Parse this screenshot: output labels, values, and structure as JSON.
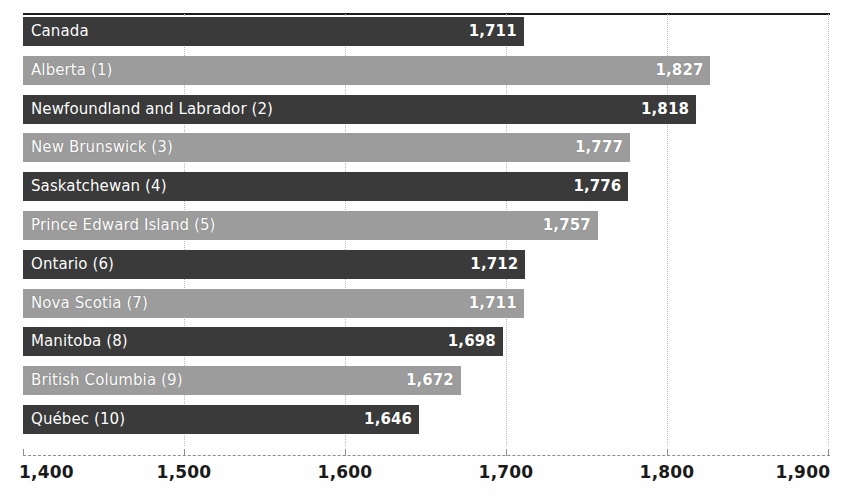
{
  "chart_data": {
    "type": "bar",
    "orientation": "horizontal",
    "title": "",
    "subtitle": "",
    "xlabel": "",
    "ylabel": "",
    "xlim": [
      1400,
      1900
    ],
    "x_ticks": [
      "1,400",
      "1,500",
      "1,600",
      "1,700",
      "1,800",
      "1,900"
    ],
    "x_tick_values": [
      1400,
      1500,
      1600,
      1700,
      1800,
      1900
    ],
    "grid": "vertical-dotted",
    "legend": "none",
    "categories": [
      "Canada",
      "Alberta (1)",
      "Newfoundland and Labrador (2)",
      "New Brunswick (3)",
      "Saskatchewan (4)",
      "Prince Edward Island (5)",
      "Ontario (6)",
      "Nova Scotia (7)",
      "Manitoba (8)",
      "British Columbia (9)",
      "Québec (10)"
    ],
    "values": [
      1711,
      1827,
      1818,
      1777,
      1776,
      1757,
      1712,
      1711,
      1698,
      1672,
      1646
    ],
    "value_labels": [
      "1,711",
      "1,827",
      "1,818",
      "1,777",
      "1,776",
      "1,757",
      "1,712",
      "1,711",
      "1,698",
      "1,672",
      "1,646"
    ],
    "bar_shades": [
      "dark",
      "light",
      "dark",
      "light",
      "dark",
      "light",
      "dark",
      "light",
      "dark",
      "light",
      "dark"
    ],
    "colors": {
      "bar_dark": "#3a3a3a",
      "bar_light": "#9c9c9c",
      "label_text": "#ffffff",
      "axis_text": "#1a1a1a",
      "gridline": "#b9b9b9",
      "top_rule": "#1c1c1c",
      "background": "#fefefe"
    }
  }
}
